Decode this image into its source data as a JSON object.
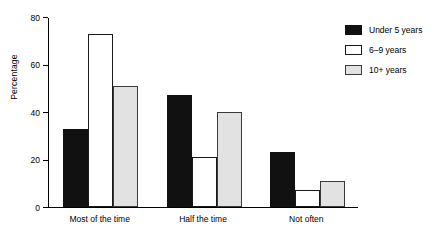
{
  "chart_data": {
    "type": "bar",
    "title": "",
    "subtitle": "",
    "xlabel": "",
    "ylabel": "Percentage",
    "categories": [
      "Most of the time",
      "Half the time",
      "Not often"
    ],
    "series": [
      {
        "name": "Under 5 years",
        "color": "#111111",
        "values": [
          33,
          47,
          23
        ]
      },
      {
        "name": "6–9 years",
        "color": "#ffffff",
        "values": [
          73,
          21,
          7
        ]
      },
      {
        "name": "10+ years",
        "color": "#e2e2e2",
        "values": [
          51,
          40,
          11
        ]
      }
    ],
    "ylim": [
      0,
      80
    ],
    "yticks": [
      0,
      20,
      40,
      60,
      80
    ],
    "ytick_labels": [
      "0",
      "20",
      "40",
      "60",
      "80"
    ],
    "grid": false,
    "legend_position": "right-top",
    "annotations": []
  },
  "legend": {
    "items": [
      {
        "label": "Under 5 years"
      },
      {
        "label": "6–9 years"
      },
      {
        "label": "10+ years"
      }
    ]
  },
  "axes": {
    "y_title": "Percentage"
  }
}
